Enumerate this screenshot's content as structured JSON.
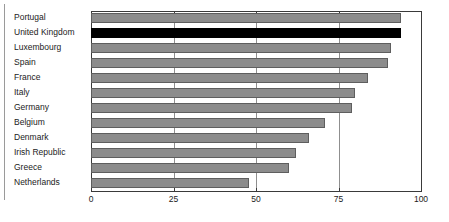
{
  "chart_data": {
    "type": "bar",
    "orientation": "horizontal",
    "title": "",
    "subtitle": "",
    "xlabel": "",
    "ylabel": "",
    "xlim": [
      0,
      100
    ],
    "xticks": [
      0,
      25,
      50,
      75,
      100
    ],
    "xtick_labels": [
      "0",
      "25",
      "50",
      "75",
      "100"
    ],
    "grid": true,
    "grid_axis": "x",
    "legend": false,
    "legend_position": "none",
    "categories": [
      "Portugal",
      "United Kingdom",
      "Luxembourg",
      "Spain",
      "France",
      "Italy",
      "Germany",
      "Belgium",
      "Denmark",
      "Irish Republic",
      "Greece",
      "Netherlands"
    ],
    "values": [
      94,
      94,
      91,
      90,
      84,
      80,
      79,
      71,
      66,
      62,
      60,
      48
    ],
    "highlight_category": "United Kingdom",
    "colors": {
      "bar_fill": "#8c8c8c",
      "bar_edge": "#5e5e5e",
      "highlight_fill": "#000000",
      "axis": "#3a3a3a",
      "gridline": "#8f8f8f",
      "text": "#1b1b1b",
      "background": "#ffffff",
      "left_rule": "#9a9a9a"
    }
  }
}
